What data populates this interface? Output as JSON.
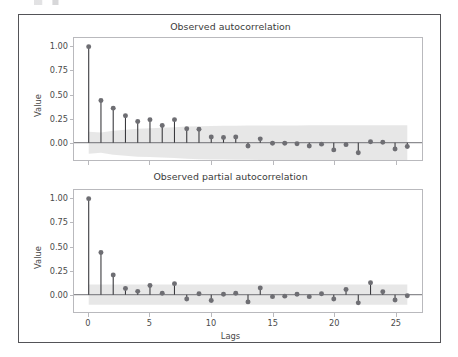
{
  "figure": {
    "background": "#ffffff",
    "border_color": "#545458",
    "marker_color": "#6e6e73",
    "stem_color": "#3a3a3e",
    "band_color": "#d9d9d9",
    "baseline_color": "#6e6e73",
    "axis_color": "#b9b9bd"
  },
  "chart_data": [
    {
      "type": "line",
      "plot_kind": "stem-correlogram",
      "title": "Observed autocorrelation",
      "xlabel": "",
      "ylabel": "Value",
      "xlim": [
        -1.2,
        27.2
      ],
      "ylim": [
        -0.18,
        1.09
      ],
      "grid": false,
      "legend": null,
      "xticks": [
        0,
        5,
        10,
        15,
        20,
        25
      ],
      "xticklabels": [
        "0",
        "5",
        "10",
        "15",
        "20",
        "25"
      ],
      "yticks": [
        0.0,
        0.25,
        0.5,
        0.75,
        1.0
      ],
      "yticklabels": [
        "0.00",
        "0.25",
        "0.50",
        "0.75",
        "1.00"
      ],
      "x": [
        0,
        1,
        2,
        3,
        4,
        5,
        6,
        7,
        8,
        9,
        10,
        11,
        12,
        13,
        14,
        15,
        16,
        17,
        18,
        19,
        20,
        21,
        22,
        23,
        24,
        25,
        26
      ],
      "values": [
        1.0,
        0.44,
        0.36,
        0.28,
        0.22,
        0.24,
        0.18,
        0.24,
        0.145,
        0.14,
        0.06,
        0.055,
        0.06,
        -0.035,
        0.04,
        -0.005,
        -0.005,
        -0.01,
        -0.035,
        -0.015,
        -0.075,
        -0.02,
        -0.105,
        0.01,
        0.005,
        -0.065,
        -0.04
      ],
      "confidence_band": {
        "upper": [
          0.115,
          0.105,
          0.125,
          0.135,
          0.145,
          0.15,
          0.155,
          0.16,
          0.168,
          0.172,
          0.175,
          0.176,
          0.177,
          0.178,
          0.179,
          0.18,
          0.18,
          0.18,
          0.181,
          0.181,
          0.181,
          0.181,
          0.182,
          0.182,
          0.182,
          0.182,
          0.182
        ],
        "lower": [
          -0.115,
          -0.105,
          -0.125,
          -0.135,
          -0.145,
          -0.15,
          -0.155,
          -0.16,
          -0.168,
          -0.172,
          -0.175,
          -0.176,
          -0.177,
          -0.178,
          -0.179,
          -0.18,
          -0.18,
          -0.18,
          -0.181,
          -0.181,
          -0.181,
          -0.181,
          -0.182,
          -0.182,
          -0.182,
          -0.182,
          -0.182
        ]
      }
    },
    {
      "type": "line",
      "plot_kind": "stem-correlogram",
      "title": "Observed partial autocorrelation",
      "xlabel": "Lags",
      "ylabel": "Value",
      "xlim": [
        -1.2,
        27.2
      ],
      "ylim": [
        -0.18,
        1.09
      ],
      "grid": false,
      "legend": null,
      "xticks": [
        0,
        5,
        10,
        15,
        20,
        25
      ],
      "xticklabels": [
        "0",
        "5",
        "10",
        "15",
        "20",
        "25"
      ],
      "yticks": [
        0.0,
        0.25,
        0.5,
        0.75,
        1.0
      ],
      "yticklabels": [
        "0.00",
        "0.25",
        "0.50",
        "0.75",
        "1.00"
      ],
      "x": [
        0,
        1,
        2,
        3,
        4,
        5,
        6,
        7,
        8,
        9,
        10,
        11,
        12,
        13,
        14,
        15,
        16,
        17,
        18,
        19,
        20,
        21,
        22,
        23,
        24,
        25,
        26
      ],
      "values": [
        1.0,
        0.44,
        0.205,
        0.065,
        0.035,
        0.095,
        0.015,
        0.115,
        -0.045,
        0.01,
        -0.06,
        0.005,
        0.015,
        -0.075,
        0.07,
        -0.02,
        -0.015,
        0.005,
        -0.02,
        0.01,
        -0.045,
        0.055,
        -0.085,
        0.125,
        0.03,
        -0.055,
        -0.01
      ],
      "confidence_band": {
        "upper": [
          0.105,
          0.105,
          0.105,
          0.105,
          0.105,
          0.105,
          0.105,
          0.105,
          0.105,
          0.105,
          0.105,
          0.105,
          0.105,
          0.105,
          0.105,
          0.105,
          0.105,
          0.105,
          0.105,
          0.105,
          0.105,
          0.105,
          0.105,
          0.105,
          0.105,
          0.105,
          0.105
        ],
        "lower": [
          -0.105,
          -0.105,
          -0.105,
          -0.105,
          -0.105,
          -0.105,
          -0.105,
          -0.105,
          -0.105,
          -0.105,
          -0.105,
          -0.105,
          -0.105,
          -0.105,
          -0.105,
          -0.105,
          -0.105,
          -0.105,
          -0.105,
          -0.105,
          -0.105,
          -0.105,
          -0.105,
          -0.105,
          -0.105,
          -0.105,
          -0.105
        ]
      }
    }
  ]
}
